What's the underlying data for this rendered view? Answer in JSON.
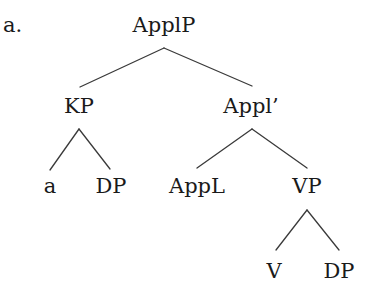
{
  "example_label": "a.",
  "tree": {
    "root": "ApplP",
    "nodes": {
      "applp": "ApplP",
      "kp": "KP",
      "appl_bar": "Appl’",
      "a": "a",
      "kp_dp": "DP",
      "appl_head": "AppL",
      "vp": "VP",
      "v": "V",
      "vp_dp": "DP"
    },
    "structure": {
      "label": "ApplP",
      "children": [
        {
          "label": "KP",
          "children": [
            {
              "label": "a"
            },
            {
              "label": "DP"
            }
          ]
        },
        {
          "label": "Appl’",
          "children": [
            {
              "label": "AppL"
            },
            {
              "label": "VP",
              "children": [
                {
                  "label": "V"
                },
                {
                  "label": "DP"
                }
              ]
            }
          ]
        }
      ]
    }
  },
  "colors": {
    "text": "#1a1a1a",
    "line": "#3a3a3a",
    "background": "#ffffff"
  }
}
